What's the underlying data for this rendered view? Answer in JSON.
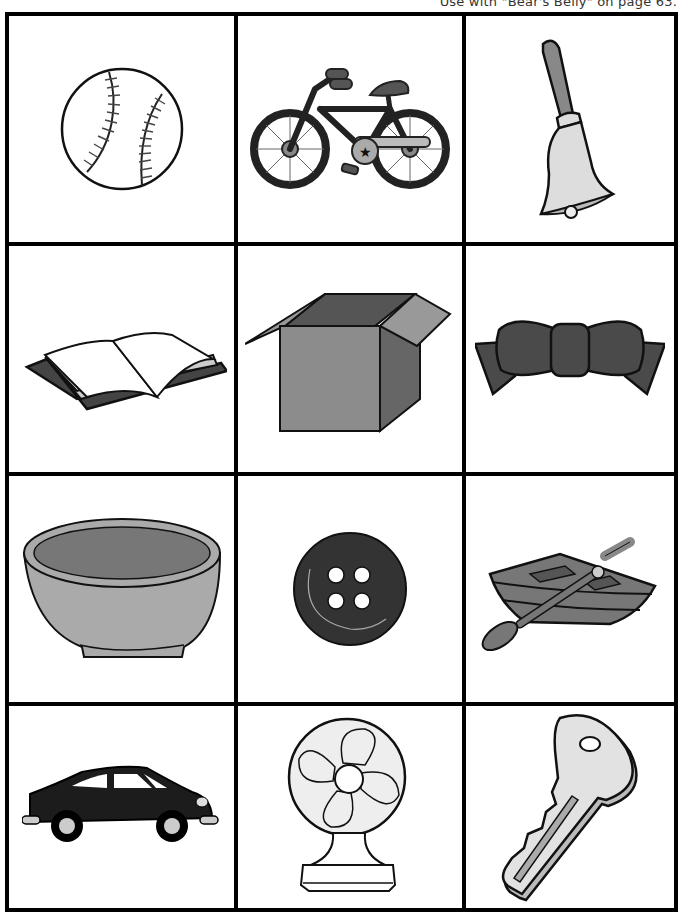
{
  "caption": "Use with \"Bear's Belly\" on page 63.",
  "cards": [
    {
      "row": 1,
      "col": 1,
      "name": "baseball",
      "icon": "baseball-icon"
    },
    {
      "row": 1,
      "col": 2,
      "name": "bicycle",
      "icon": "bicycle-icon"
    },
    {
      "row": 1,
      "col": 3,
      "name": "bell",
      "icon": "bell-icon"
    },
    {
      "row": 2,
      "col": 1,
      "name": "book",
      "icon": "book-icon"
    },
    {
      "row": 2,
      "col": 2,
      "name": "box",
      "icon": "box-icon"
    },
    {
      "row": 2,
      "col": 3,
      "name": "bow",
      "icon": "bow-icon"
    },
    {
      "row": 3,
      "col": 1,
      "name": "bowl",
      "icon": "bowl-icon"
    },
    {
      "row": 3,
      "col": 2,
      "name": "button",
      "icon": "button-icon"
    },
    {
      "row": 3,
      "col": 3,
      "name": "boat",
      "icon": "boat-icon"
    },
    {
      "row": 4,
      "col": 1,
      "name": "car",
      "icon": "car-icon"
    },
    {
      "row": 4,
      "col": 2,
      "name": "fan",
      "icon": "fan-icon"
    },
    {
      "row": 4,
      "col": 3,
      "name": "key",
      "icon": "key-icon"
    }
  ],
  "colors": {
    "border": "#000000",
    "dark_fill": "#4a4a4a",
    "mid_fill": "#8c8c8c",
    "light_fill": "#d9d9d9"
  }
}
